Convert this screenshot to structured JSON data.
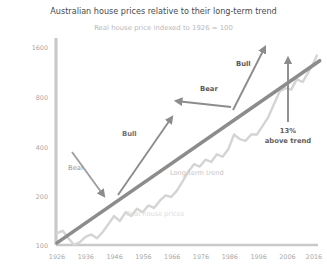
{
  "chart_data": {
    "type": "line",
    "title": "Australian house prices relative to their long-term trend",
    "subtitle": "Real house price indexed to 1926 = 100",
    "xlabel": "",
    "ylabel": "",
    "yscale": "log",
    "ylim": [
      100,
      1800
    ],
    "xlim": [
      1926,
      2018
    ],
    "grid": false,
    "legend": "none",
    "yticks": [
      "100",
      "200",
      "400",
      "800",
      "1600"
    ],
    "ytick_values": [
      100,
      200,
      400,
      800,
      1600
    ],
    "xticks": [
      "1926",
      "1936",
      "1946",
      "1956",
      "1966",
      "1976",
      "1986",
      "1996",
      "2006",
      "2016"
    ],
    "xtick_values": [
      1926,
      1936,
      1946,
      1956,
      1966,
      1976,
      1986,
      1996,
      2006,
      2016
    ],
    "series": [
      {
        "name": "Real house prices",
        "color": "#d4d4d4",
        "x": [
          1926,
          1928,
          1930,
          1932,
          1934,
          1936,
          1938,
          1940,
          1942,
          1944,
          1946,
          1948,
          1950,
          1952,
          1954,
          1956,
          1958,
          1960,
          1962,
          1964,
          1966,
          1968,
          1970,
          1972,
          1974,
          1976,
          1978,
          1980,
          1982,
          1984,
          1986,
          1988,
          1990,
          1992,
          1994,
          1996,
          1998,
          2000,
          2002,
          2004,
          2006,
          2008,
          2010,
          2012,
          2014,
          2016,
          2017
        ],
        "values": [
          118,
          122,
          110,
          100,
          104,
          112,
          116,
          110,
          120,
          134,
          150,
          140,
          158,
          150,
          166,
          158,
          174,
          168,
          186,
          200,
          196,
          214,
          244,
          280,
          310,
          300,
          330,
          320,
          356,
          344,
          382,
          470,
          440,
          430,
          470,
          470,
          530,
          600,
          720,
          860,
          900,
          880,
          1020,
          980,
          1120,
          1300,
          1420
        ]
      },
      {
        "name": "Long-term trend",
        "color": "#8c8c8c",
        "x": [
          1926,
          2018
        ],
        "values": [
          103,
          1320
        ]
      }
    ],
    "annotations": [
      {
        "label": "Bear",
        "style": "light",
        "x": 68,
        "y": 170
      },
      {
        "label": "Bull",
        "style": "mid",
        "x": 122,
        "y": 136
      },
      {
        "label": "Bear",
        "style": "bold",
        "x": 200,
        "y": 91
      },
      {
        "label": "Bull",
        "style": "bold",
        "x": 236,
        "y": 66
      },
      {
        "label": "Long-term trend",
        "style": "trend",
        "x": 170,
        "y": 175
      },
      {
        "label": "Real house prices",
        "style": "series",
        "x": 126,
        "y": 216
      }
    ],
    "callout": {
      "value": "13%",
      "caption": "above trend"
    },
    "colors": {
      "series_line": "#d4d4d4",
      "trend_line": "#8c8c8c",
      "arrow": "#8c8c8c",
      "axis": "#c9c9c9",
      "title": "#4a4a4a",
      "subtitle": "#b9b9b9",
      "tick": "#a8a8a8"
    }
  }
}
